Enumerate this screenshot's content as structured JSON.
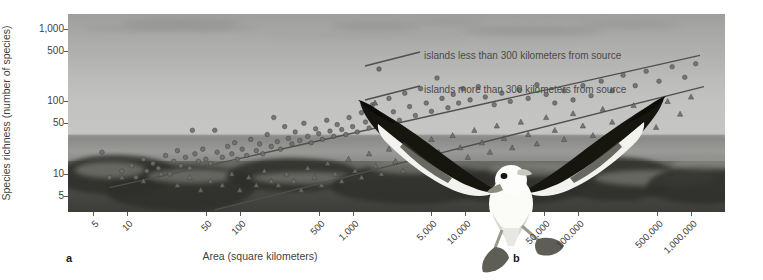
{
  "figure": {
    "panels": [
      {
        "letter": "a",
        "kind": "scatter-plot"
      },
      {
        "letter": "b",
        "kind": "photograph-albatross"
      }
    ]
  },
  "axes": {
    "ylabel": "Species richness (number of species)",
    "xlabel": "Area (square kilometers)",
    "ytick_labels": [
      "1,000",
      "500",
      "100",
      "50",
      "10",
      "5"
    ],
    "xtick_labels": [
      "5",
      "10",
      "50",
      "100",
      "500",
      "1,000",
      "5,000",
      "10,000",
      "50,000",
      "100,000",
      "500,000",
      "1,000,000"
    ]
  },
  "legend": {
    "items": [
      {
        "label": "islands less than 300 kilometers from source",
        "marker": "circle"
      },
      {
        "label": "islands more than 300 kilometers from source",
        "marker": "triangle"
      }
    ]
  },
  "colors": {
    "marker_near": "#6e6e6e",
    "marker_far": "#6e6e6e",
    "trendline": "#4f4f4f",
    "axis_text": "#3f3f3f",
    "photo_sky": "#b6b6b4",
    "photo_sea": "#8f8f8d",
    "photo_rock": "#44443f"
  },
  "chart_data": {
    "type": "scatter",
    "title": "",
    "xlabel": "Area (square kilometers)",
    "ylabel": "Species richness (number of species)",
    "xscale": "log",
    "yscale": "log",
    "xlim": [
      3,
      2000000
    ],
    "ylim": [
      3,
      1600
    ],
    "grid": false,
    "legend_position": "right-inside",
    "xticks": [
      5,
      10,
      50,
      100,
      500,
      1000,
      5000,
      10000,
      50000,
      100000,
      500000,
      1000000
    ],
    "xtick_labels": [
      "5",
      "10",
      "50",
      "100",
      "500",
      "1,000",
      "5,000",
      "10,000",
      "50,000",
      "100,000",
      "500,000",
      "1,000,000"
    ],
    "yticks": [
      5,
      10,
      50,
      100,
      500,
      1000
    ],
    "ytick_labels": [
      "5",
      "10",
      "50",
      "100",
      "500",
      "1,000"
    ],
    "series": [
      {
        "name": "islands less than 300 kilometers from source",
        "marker": "circle",
        "color": "#6e6e6e",
        "trendline": {
          "x": [
            7,
            1200000
          ],
          "y": [
            6.5,
            430
          ]
        },
        "points": [
          [
            6,
            20
          ],
          [
            7,
            9
          ],
          [
            9,
            11
          ],
          [
            11,
            13
          ],
          [
            12,
            9
          ],
          [
            14,
            16
          ],
          [
            15,
            11
          ],
          [
            17,
            14
          ],
          [
            19,
            12
          ],
          [
            22,
            18
          ],
          [
            24,
            10
          ],
          [
            26,
            15
          ],
          [
            28,
            21
          ],
          [
            30,
            13
          ],
          [
            33,
            17
          ],
          [
            36,
            12
          ],
          [
            38,
            40
          ],
          [
            40,
            19
          ],
          [
            43,
            15
          ],
          [
            47,
            22
          ],
          [
            50,
            16
          ],
          [
            55,
            14
          ],
          [
            60,
            40
          ],
          [
            63,
            20
          ],
          [
            70,
            17
          ],
          [
            78,
            24
          ],
          [
            85,
            19
          ],
          [
            90,
            27
          ],
          [
            95,
            16
          ],
          [
            105,
            22
          ],
          [
            115,
            18
          ],
          [
            125,
            30
          ],
          [
            140,
            21
          ],
          [
            150,
            26
          ],
          [
            160,
            19
          ],
          [
            175,
            35
          ],
          [
            190,
            24
          ],
          [
            200,
            60
          ],
          [
            215,
            28
          ],
          [
            230,
            22
          ],
          [
            250,
            45
          ],
          [
            270,
            31
          ],
          [
            290,
            26
          ],
          [
            310,
            38
          ],
          [
            340,
            29
          ],
          [
            370,
            50
          ],
          [
            400,
            33
          ],
          [
            430,
            27
          ],
          [
            470,
            42
          ],
          [
            500,
            36
          ],
          [
            540,
            30
          ],
          [
            590,
            55
          ],
          [
            630,
            39
          ],
          [
            680,
            33
          ],
          [
            730,
            48
          ],
          [
            800,
            41
          ],
          [
            870,
            35
          ],
          [
            930,
            60
          ],
          [
            1000,
            45
          ],
          [
            1100,
            38
          ],
          [
            1200,
            70
          ],
          [
            1300,
            52
          ],
          [
            1400,
            43
          ],
          [
            1500,
            90
          ],
          [
            1700,
            60
          ],
          [
            1900,
            48
          ],
          [
            2100,
            110
          ],
          [
            2300,
            72
          ],
          [
            2600,
            55
          ],
          [
            2900,
            130
          ],
          [
            3200,
            85
          ],
          [
            3600,
            64
          ],
          [
            4000,
            150
          ],
          [
            4500,
            95
          ],
          [
            5000,
            73
          ],
          [
            5600,
            210
          ],
          [
            6200,
            110
          ],
          [
            7000,
            82
          ],
          [
            7800,
            125
          ],
          [
            8700,
            95
          ],
          [
            9500,
            150
          ],
          [
            11000,
            105
          ],
          [
            13000,
            160
          ],
          [
            15000,
            115
          ],
          [
            18000,
            90
          ],
          [
            21000,
            130
          ],
          [
            25000,
            100
          ],
          [
            30000,
            145
          ],
          [
            36000,
            110
          ],
          [
            43000,
            170
          ],
          [
            52000,
            125
          ],
          [
            62000,
            95
          ],
          [
            75000,
            140
          ],
          [
            90000,
            105
          ],
          [
            110000,
            165
          ],
          [
            130000,
            120
          ],
          [
            160000,
            190
          ],
          [
            200000,
            140
          ],
          [
            250000,
            230
          ],
          [
            320000,
            165
          ],
          [
            400000,
            260
          ],
          [
            520000,
            190
          ],
          [
            680000,
            300
          ],
          [
            880000,
            215
          ],
          [
            1100000,
            330
          ]
        ]
      },
      {
        "name": "islands more than 300 kilometers from source",
        "marker": "triangle",
        "color": "#6e6e6e",
        "trendline": {
          "x": [
            60,
            1300000
          ],
          "y": [
            3.2,
            160
          ]
        },
        "points": [
          [
            9,
            9
          ],
          [
            14,
            8
          ],
          [
            20,
            10
          ],
          [
            28,
            7
          ],
          [
            36,
            9
          ],
          [
            45,
            6
          ],
          [
            55,
            8
          ],
          [
            70,
            7
          ],
          [
            85,
            10
          ],
          [
            100,
            6
          ],
          [
            120,
            9
          ],
          [
            140,
            7
          ],
          [
            165,
            11
          ],
          [
            190,
            8
          ],
          [
            220,
            7
          ],
          [
            260,
            10
          ],
          [
            300,
            8
          ],
          [
            350,
            6
          ],
          [
            400,
            12
          ],
          [
            460,
            9
          ],
          [
            530,
            7
          ],
          [
            600,
            14
          ],
          [
            700,
            10
          ],
          [
            800,
            8
          ],
          [
            920,
            16
          ],
          [
            1050,
            11
          ],
          [
            1200,
            9
          ],
          [
            1400,
            19
          ],
          [
            1600,
            13
          ],
          [
            1800,
            10
          ],
          [
            2100,
            22
          ],
          [
            2400,
            15
          ],
          [
            2800,
            11
          ],
          [
            3200,
            26
          ],
          [
            3700,
            17
          ],
          [
            4300,
            13
          ],
          [
            5000,
            30
          ],
          [
            5800,
            20
          ],
          [
            6700,
            15
          ],
          [
            7700,
            34
          ],
          [
            9000,
            23
          ],
          [
            10500,
            17
          ],
          [
            12000,
            40
          ],
          [
            14000,
            27
          ],
          [
            16500,
            20
          ],
          [
            19000,
            46
          ],
          [
            22000,
            31
          ],
          [
            26000,
            23
          ],
          [
            31000,
            52
          ],
          [
            36000,
            35
          ],
          [
            43000,
            26
          ],
          [
            52000,
            60
          ],
          [
            62000,
            40
          ],
          [
            75000,
            30
          ],
          [
            90000,
            68
          ],
          [
            110000,
            46
          ],
          [
            135000,
            34
          ],
          [
            165000,
            78
          ],
          [
            200000,
            52
          ],
          [
            250000,
            39
          ],
          [
            310000,
            88
          ],
          [
            390000,
            59
          ],
          [
            490000,
            44
          ],
          [
            620000,
            100
          ],
          [
            800000,
            67
          ],
          [
            1000000,
            115
          ]
        ]
      }
    ]
  }
}
